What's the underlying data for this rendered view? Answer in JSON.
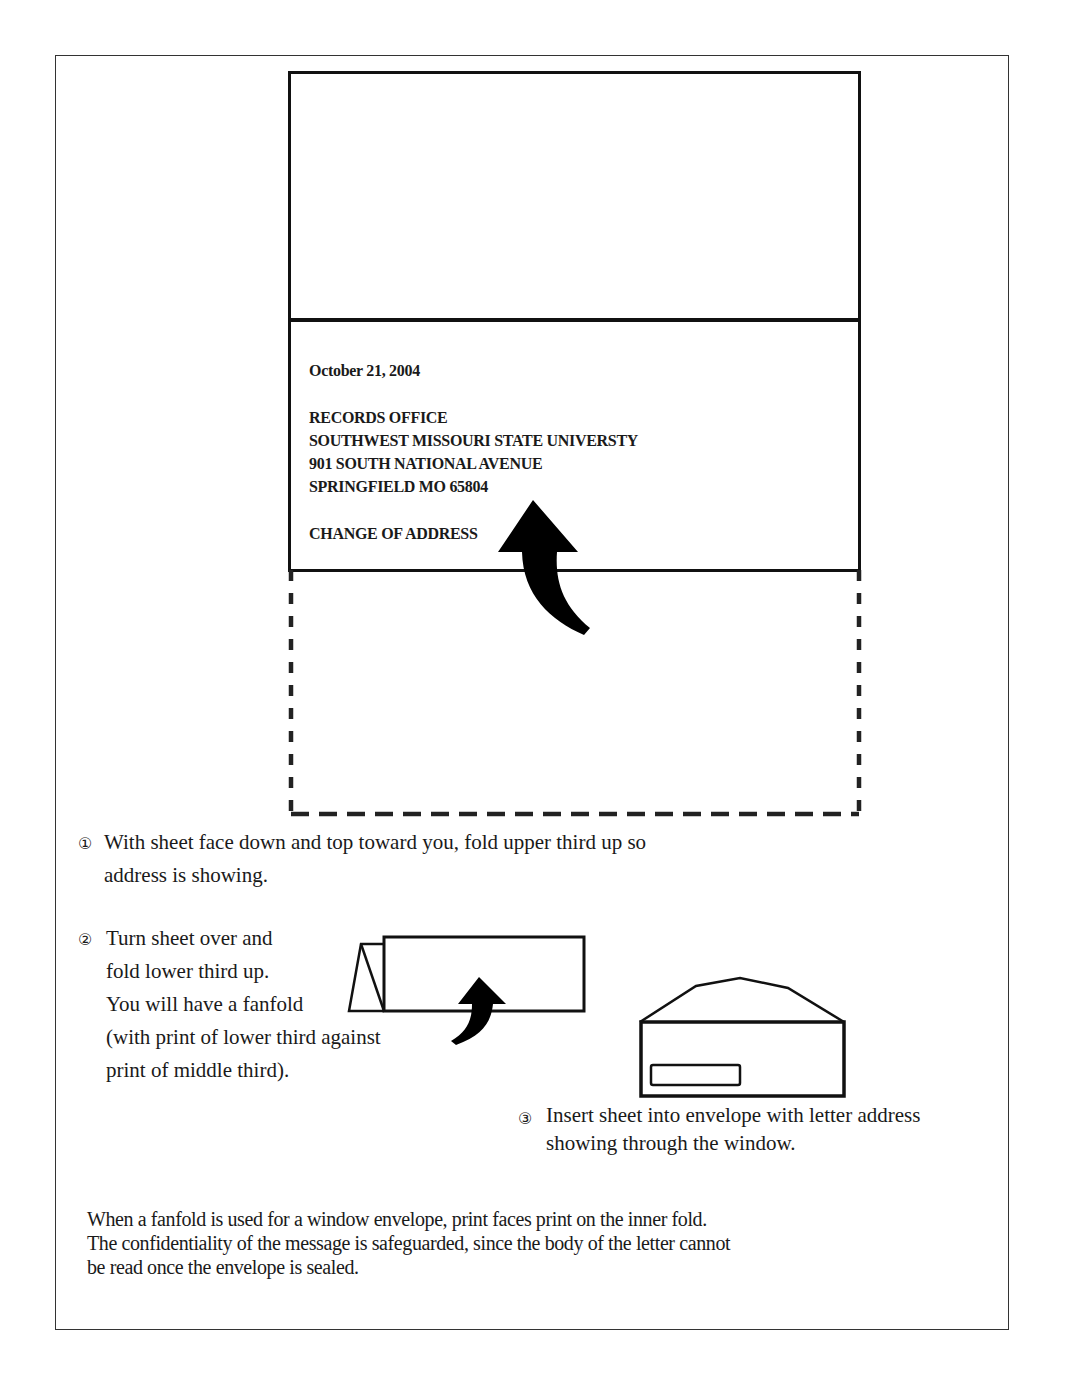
{
  "letter": {
    "date": "October 21, 2004",
    "address_lines": [
      "RECORDS OFFICE",
      "SOUTHWEST MISSOURI STATE UNIVERSTY",
      "901 SOUTH NATIONAL AVENUE",
      "SPRINGFIELD MO 65804"
    ],
    "subject": "CHANGE OF ADDRESS"
  },
  "steps": [
    {
      "number": "①",
      "lines": [
        "With sheet face down and top toward you, fold upper third up so",
        "address is showing."
      ]
    },
    {
      "number": "②",
      "lines": [
        "Turn sheet over and",
        "fold lower third up.",
        "You will have a fanfold",
        "(with print of lower third against",
        "print of middle third)."
      ]
    },
    {
      "number": "③",
      "lines": [
        "Insert sheet into envelope with letter address",
        "showing through the window."
      ]
    }
  ],
  "note": {
    "lines": [
      "When a fanfold is used for a window envelope, print faces print on the inner fold.",
      "The confidentiality of the message is safeguarded, since the body of the letter cannot",
      "be read once the envelope is sealed."
    ]
  },
  "icons": {
    "fold_arrow_large": "curved-up-arrow-icon",
    "fold_arrow_small": "curved-up-arrow-icon",
    "fanfold": "fanfold-sheet-icon",
    "envelope": "window-envelope-icon"
  }
}
